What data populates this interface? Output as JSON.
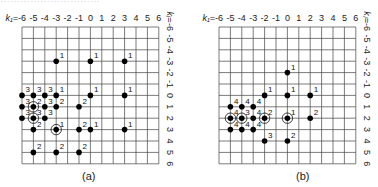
{
  "top_text": "…………………………",
  "panels": [
    {
      "id": "a",
      "caption": "(a)",
      "origin_x": 22,
      "origin_y": 27,
      "step": 11.4,
      "x_axis_label": "k₁=",
      "y_axis_label": "kᵢ=",
      "points": [
        {
          "k1": -3,
          "ki": -3,
          "label": "1",
          "circled": false
        },
        {
          "k1": 0,
          "ki": -3,
          "label": "1",
          "circled": false
        },
        {
          "k1": 3,
          "ki": -3,
          "label": "1",
          "circled": false
        },
        {
          "k1": -6,
          "ki": 0,
          "label": "3",
          "circled": false
        },
        {
          "k1": -5,
          "ki": 0,
          "label": "3",
          "circled": false
        },
        {
          "k1": -4,
          "ki": 0,
          "label": "3",
          "circled": false
        },
        {
          "k1": -3,
          "ki": 0,
          "label": "1",
          "circled": false
        },
        {
          "k1": 0,
          "ki": 0,
          "label": "1",
          "circled": false
        },
        {
          "k1": 3,
          "ki": 0,
          "label": "1",
          "circled": false
        },
        {
          "k1": -6,
          "ki": 1,
          "label": "3",
          "circled": false
        },
        {
          "k1": -5,
          "ki": 1,
          "label": "2",
          "circled": true
        },
        {
          "k1": -4,
          "ki": 1,
          "label": "3",
          "circled": false
        },
        {
          "k1": -3,
          "ki": 1,
          "label": "2",
          "circled": false
        },
        {
          "k1": -1,
          "ki": 1,
          "label": "2",
          "circled": false
        },
        {
          "k1": -6,
          "ki": 2,
          "label": "3",
          "circled": false
        },
        {
          "k1": -5,
          "ki": 2,
          "label": "3",
          "circled": true
        },
        {
          "k1": -4,
          "ki": 2,
          "label": "3",
          "circled": false
        },
        {
          "k1": -5,
          "ki": 3,
          "label": "2",
          "circled": false
        },
        {
          "k1": -3,
          "ki": 3,
          "label": "1",
          "circled": true
        },
        {
          "k1": -1,
          "ki": 3,
          "label": "2",
          "circled": false
        },
        {
          "k1": 0,
          "ki": 3,
          "label": "1",
          "circled": false
        },
        {
          "k1": 3,
          "ki": 3,
          "label": "1",
          "circled": false
        },
        {
          "k1": -5,
          "ki": 5,
          "label": "2",
          "circled": false
        },
        {
          "k1": -3,
          "ki": 5,
          "label": "2",
          "circled": false
        },
        {
          "k1": -1,
          "ki": 5,
          "label": "2",
          "circled": false
        }
      ]
    },
    {
      "id": "b",
      "caption": "(b)",
      "origin_x": 219,
      "origin_y": 27,
      "step": 11.4,
      "x_axis_label": "k₁=",
      "y_axis_label": "kⱼ=",
      "points": [
        {
          "k1": 0,
          "ki": -2,
          "label": "1",
          "circled": false
        },
        {
          "k1": -2,
          "ki": 0,
          "label": "1",
          "circled": false
        },
        {
          "k1": 0,
          "ki": 0,
          "label": "1",
          "circled": false
        },
        {
          "k1": 2,
          "ki": 0,
          "label": "1",
          "circled": false
        },
        {
          "k1": -5,
          "ki": 1,
          "label": "4",
          "circled": false
        },
        {
          "k1": -4,
          "ki": 1,
          "label": "4",
          "circled": false
        },
        {
          "k1": -3,
          "ki": 1,
          "label": "4",
          "circled": false
        },
        {
          "k1": -5,
          "ki": 2,
          "label": "4",
          "circled": true
        },
        {
          "k1": -4,
          "ki": 2,
          "label": "3",
          "circled": true
        },
        {
          "k1": -3,
          "ki": 2,
          "label": "4",
          "circled": false
        },
        {
          "k1": -2,
          "ki": 2,
          "label": "2",
          "circled": true
        },
        {
          "k1": 0,
          "ki": 2,
          "label": "1",
          "circled": true
        },
        {
          "k1": 2,
          "ki": 2,
          "label": "2",
          "circled": false
        },
        {
          "k1": -5,
          "ki": 3,
          "label": "4",
          "circled": false
        },
        {
          "k1": -4,
          "ki": 3,
          "label": "4",
          "circled": false
        },
        {
          "k1": -3,
          "ki": 3,
          "label": "4",
          "circled": false
        },
        {
          "k1": -2,
          "ki": 4,
          "label": "3",
          "circled": false
        },
        {
          "k1": 0,
          "ki": 4,
          "label": "2",
          "circled": false
        }
      ]
    }
  ],
  "ticks": [
    "-6",
    "-5",
    "-4",
    "-3",
    "-2",
    "-1",
    "0",
    "1",
    "2",
    "3",
    "4",
    "5",
    "6"
  ]
}
